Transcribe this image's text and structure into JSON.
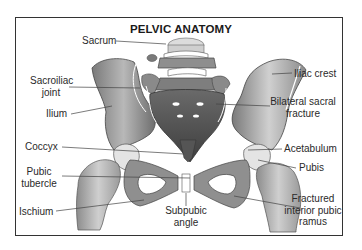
{
  "title": "PELVIC ANATOMY",
  "labels": {
    "sacrum": "Sacrum",
    "sacroiliac_joint_1": "Sacroiliac",
    "sacroiliac_joint_2": "joint",
    "ilium": "Ilium",
    "coccyx": "Coccyx",
    "pubic_tubercle_1": "Pubic",
    "pubic_tubercle_2": "tubercle",
    "ischium": "Ischium",
    "subpubic_angle_1": "Subpubic",
    "subpubic_angle_2": "angle",
    "iliac_crest": "Iliac crest",
    "bilateral_sacral_fracture_1": "Bilateral sacral",
    "bilateral_sacral_fracture_2": "fracture",
    "acetabulum": "Acetabulum",
    "pubis": "Pubis",
    "fractured_pubic_ramus_1": "Fractured",
    "fractured_pubic_ramus_2": "interior pubic",
    "fractured_pubic_ramus_3": "ramus"
  },
  "colors": {
    "frame": "#333333",
    "bone_dark": "#5a5a5a",
    "bone_mid": "#9a9a9a",
    "bone_light": "#d6d6d6",
    "leader": "#444444"
  }
}
